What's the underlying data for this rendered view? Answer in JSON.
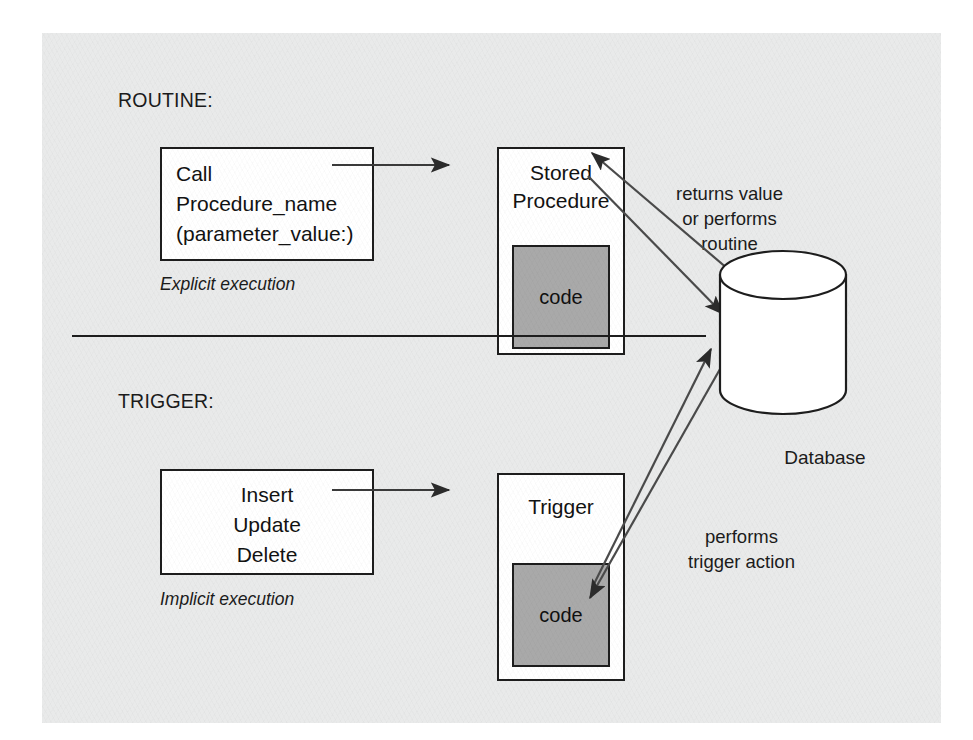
{
  "diagram": {
    "title_routine": "ROUTINE:",
    "title_trigger": "TRIGGER:",
    "routine": {
      "call_box": {
        "line1": "Call",
        "line2": "Procedure_name",
        "line3": "(parameter_value:)"
      },
      "caption": "Explicit execution",
      "procedure_box": {
        "title_line1": "Stored",
        "title_line2": "Procedure",
        "code_label": "code"
      },
      "annotation": {
        "line1": "returns value",
        "line2": "or performs",
        "line3": "routine"
      }
    },
    "trigger": {
      "action_box": {
        "line1": "Insert",
        "line2": "Update",
        "line3": "Delete"
      },
      "caption": "Implicit execution",
      "trigger_box": {
        "title": "Trigger",
        "code_label": "code"
      },
      "annotation": {
        "line1": "performs",
        "line2": "trigger action"
      }
    },
    "database": {
      "label": "Database"
    },
    "colors": {
      "panel_background": "#e9eaea",
      "box_fill": "#ffffff",
      "code_fill": "#a9a9a9",
      "stroke": "#1d1d1d",
      "text": "#1b1b1b"
    }
  }
}
